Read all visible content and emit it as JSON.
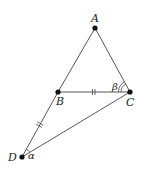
{
  "diagram": {
    "type": "geometry",
    "points": [
      {
        "id": "A",
        "label": "A"
      },
      {
        "id": "B",
        "label": "B"
      },
      {
        "id": "C",
        "label": "C"
      },
      {
        "id": "D",
        "label": "D"
      }
    ],
    "segments": [
      {
        "from": "A",
        "to": "B"
      },
      {
        "from": "A",
        "to": "C"
      },
      {
        "from": "B",
        "to": "C",
        "marks": 2
      },
      {
        "from": "B",
        "to": "D",
        "marks": 2
      },
      {
        "from": "C",
        "to": "D"
      }
    ],
    "angles": [
      {
        "vertex": "C",
        "label": "β",
        "arcs": 2,
        "between": [
          "A",
          "B"
        ]
      },
      {
        "vertex": "D",
        "label": "α",
        "arcs": 1,
        "between": [
          "B",
          "C"
        ]
      }
    ]
  }
}
